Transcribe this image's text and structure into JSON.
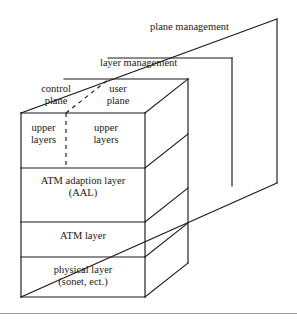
{
  "figure": {
    "background_color": "#ffffff",
    "line_color": "#1a1a1a",
    "text_color": "#202020"
  },
  "planes": {
    "plane_management": "plane management",
    "layer_management": "layer management",
    "control_plane": "control\nplane",
    "user_plane": "user\nplane"
  },
  "front_stack": {
    "upper_layers_left": "upper\nlayers",
    "upper_layers_right": "upper\nlayers",
    "aal": "ATM adaption layer\n(AAL)",
    "atm_layer": "ATM layer",
    "physical_layer": "physical layer\n(sonet, ect.)"
  },
  "geometry": {
    "front_left_x": 21,
    "front_right_x": 145,
    "front_top_y": 113,
    "front_bottom_y": 297,
    "depth_dx": 43,
    "depth_dy": -31,
    "layer_mgmt_plane_x": 232,
    "plane_mgmt_plane_x": 277,
    "divider_ys": [
      168,
      222,
      257
    ],
    "dashed_divider_x": 66
  },
  "footer": {
    "rule_y": 313
  }
}
